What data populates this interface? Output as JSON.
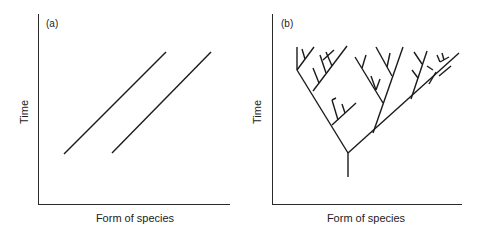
{
  "figure": {
    "panels": [
      {
        "id": "a",
        "label": "(a)",
        "ylabel": "Time",
        "xlabel": "Form of species",
        "description": "Two parallel diagonal lines (independent lineages changing steadily over time)"
      },
      {
        "id": "b",
        "label": "(b)",
        "ylabel": "Time",
        "xlabel": "Form of species",
        "description": "Branching tree of lineages diverging from a single ancestral stem"
      }
    ]
  },
  "colors": {
    "ink": "#1a1a1a",
    "axis": "#2a2a2a",
    "background": "#ffffff"
  }
}
